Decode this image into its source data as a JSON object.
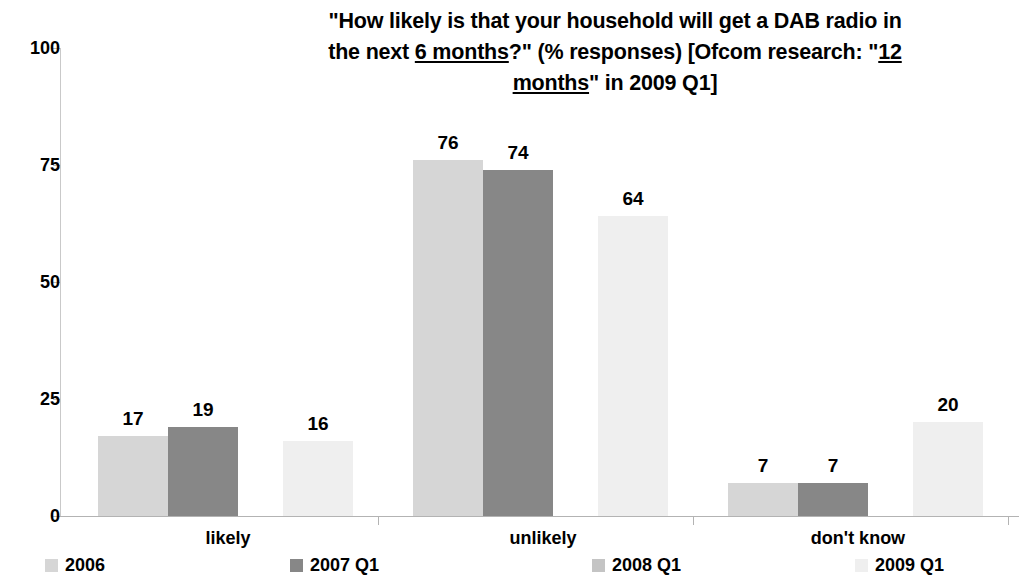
{
  "title": {
    "line1": "\"How likely is that your household will get a DAB radio in",
    "line2_a": "the next ",
    "line2_u": "6 months",
    "line2_b": "?\" (% responses) [Ofcom research: \"",
    "line2_c": "12",
    "line3_u": "months",
    "line3_b": "\" in 2009 Q1]"
  },
  "chart_data": {
    "type": "bar",
    "title": "\"How likely is that your household will get a DAB radio in the next 6 months?\" (% responses) [Ofcom research: \"12 months\" in 2009 Q1]",
    "xlabel": "",
    "ylabel": "",
    "ylim": [
      0,
      100
    ],
    "yticks": [
      0,
      25,
      50,
      75,
      100
    ],
    "ytick_labels": [
      "0",
      "25",
      "50",
      "75",
      "100"
    ],
    "grid": false,
    "legend_position": "bottom",
    "categories": [
      "likely",
      "unlikely",
      "don't know"
    ],
    "series": [
      {
        "name": "2006",
        "color": "#d6d6d6",
        "values": [
          17,
          76,
          7
        ]
      },
      {
        "name": "2007 Q1",
        "color": "#878787",
        "values": [
          19,
          74,
          7
        ]
      },
      {
        "name": "2008 Q1",
        "color": "#c4c4c4",
        "values": [
          null,
          null,
          null
        ]
      },
      {
        "name": "2009 Q1",
        "color": "#efefef",
        "values": [
          16,
          64,
          20
        ]
      }
    ],
    "data_labels": [
      {
        "series": "2006",
        "category": "likely",
        "text": "17"
      },
      {
        "series": "2007 Q1",
        "category": "likely",
        "text": "19"
      },
      {
        "series": "2009 Q1",
        "category": "likely",
        "text": "16"
      },
      {
        "series": "2006",
        "category": "unlikely",
        "text": "76"
      },
      {
        "series": "2007 Q1",
        "category": "unlikely",
        "text": "74"
      },
      {
        "series": "2009 Q1",
        "category": "unlikely",
        "text": "64"
      },
      {
        "series": "2006",
        "category": "don't know",
        "text": "7"
      },
      {
        "series": "2007 Q1",
        "category": "don't know",
        "text": "7"
      },
      {
        "series": "2009 Q1",
        "category": "don't know",
        "text": "20"
      }
    ]
  },
  "axis": {
    "y_ticks": [
      "100",
      "75",
      "50",
      "25",
      "0"
    ]
  },
  "categories": [
    {
      "label": "likely"
    },
    {
      "label": "unlikely"
    },
    {
      "label": "don't know"
    }
  ],
  "legend": [
    {
      "label": "2006",
      "color": "#d6d6d6"
    },
    {
      "label": "2007 Q1",
      "color": "#878787"
    },
    {
      "label": "2008 Q1",
      "color": "#c4c4c4"
    },
    {
      "label": "2009 Q1",
      "color": "#efefef"
    }
  ],
  "bars": [
    {
      "label": "17",
      "value": 17,
      "series": "2006",
      "category": "likely"
    },
    {
      "label": "19",
      "value": 19,
      "series": "2007 Q1",
      "category": "likely"
    },
    {
      "label": "16",
      "value": 16,
      "series": "2009 Q1",
      "category": "likely"
    },
    {
      "label": "76",
      "value": 76,
      "series": "2006",
      "category": "unlikely"
    },
    {
      "label": "74",
      "value": 74,
      "series": "2007 Q1",
      "category": "unlikely"
    },
    {
      "label": "64",
      "value": 64,
      "series": "2009 Q1",
      "category": "unlikely"
    },
    {
      "label": "7",
      "value": 7,
      "series": "2006",
      "category": "don't know"
    },
    {
      "label": "7",
      "value": 7,
      "series": "2007 Q1",
      "category": "don't know"
    },
    {
      "label": "20",
      "value": 20,
      "series": "2009 Q1",
      "category": "don't know"
    }
  ]
}
